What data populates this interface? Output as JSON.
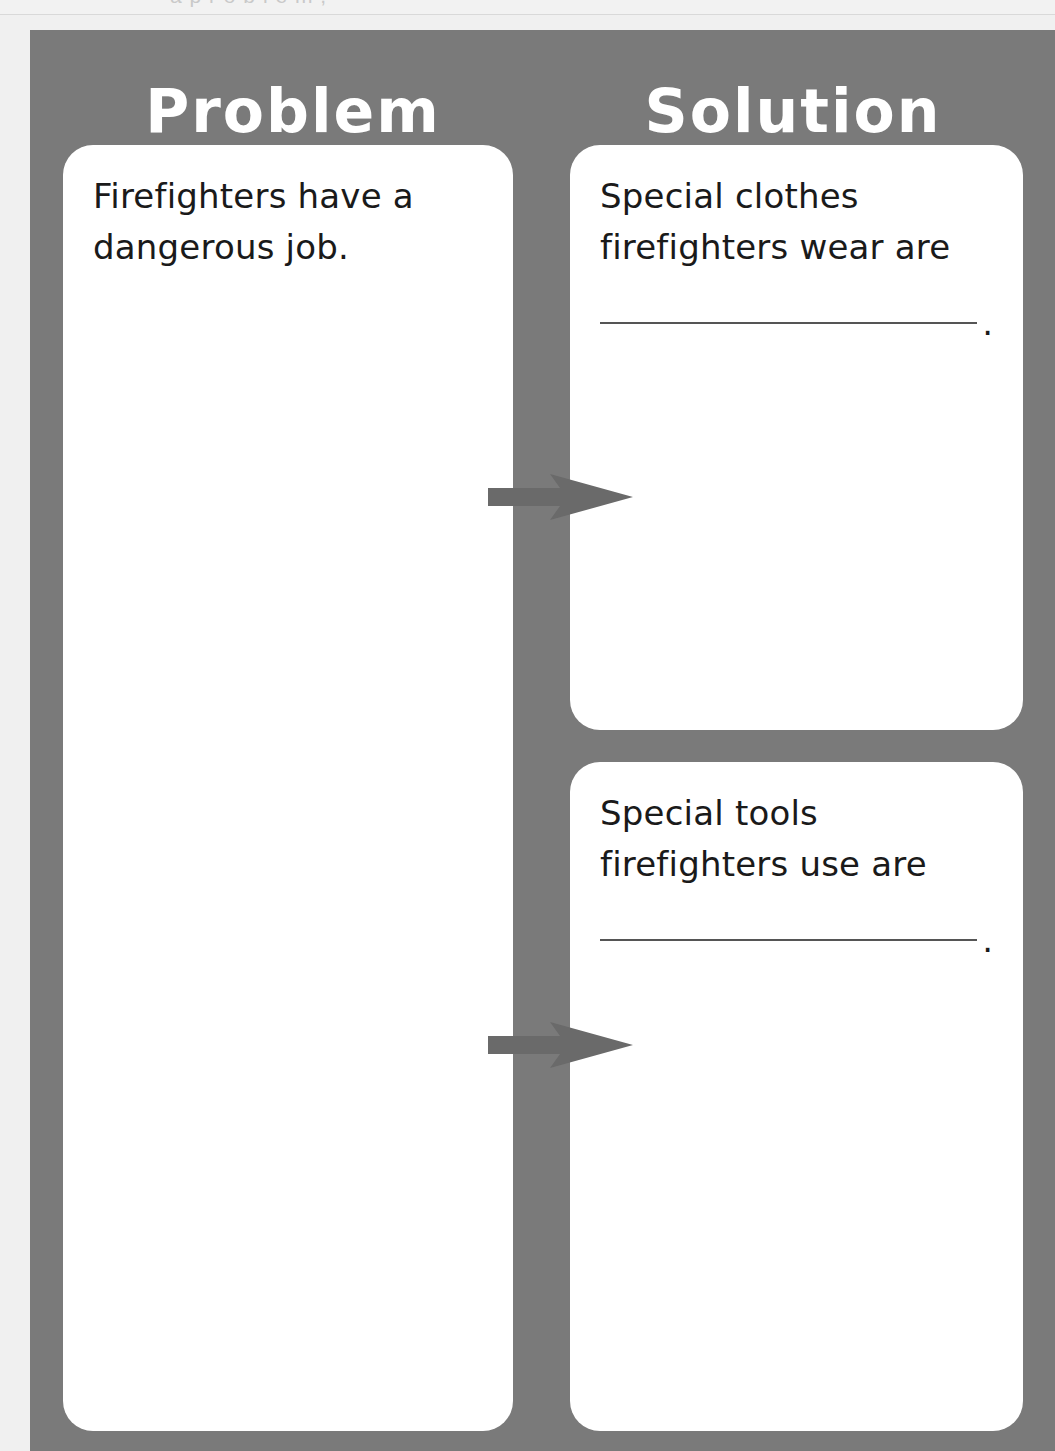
{
  "page": {
    "bleed_text": "a  p  r  o  b  l  e  m   ,",
    "background_color": "#f0f0f0",
    "panel_color": "#7a7a7a",
    "card_color": "#ffffff",
    "arrow_color": "#6a6a6a",
    "heading_color": "#ffffff",
    "text_color": "#1a1a1a"
  },
  "columns": {
    "problem": {
      "heading": "Problem"
    },
    "solution": {
      "heading": "Solution"
    }
  },
  "cards": {
    "problem": {
      "text": "Firefighters have a\ndangerous job.",
      "has_blank": false
    },
    "solution_1": {
      "text": "Special clothes\nfirefighters wear are",
      "has_blank": true,
      "blank_period": "."
    },
    "solution_2": {
      "text": "Special tools\nfirefighters use are",
      "has_blank": true,
      "blank_period": "."
    }
  },
  "arrows": [
    {
      "name": "arrow-problem-to-solution-1",
      "direction": "right"
    },
    {
      "name": "arrow-problem-to-solution-2",
      "direction": "right"
    }
  ]
}
